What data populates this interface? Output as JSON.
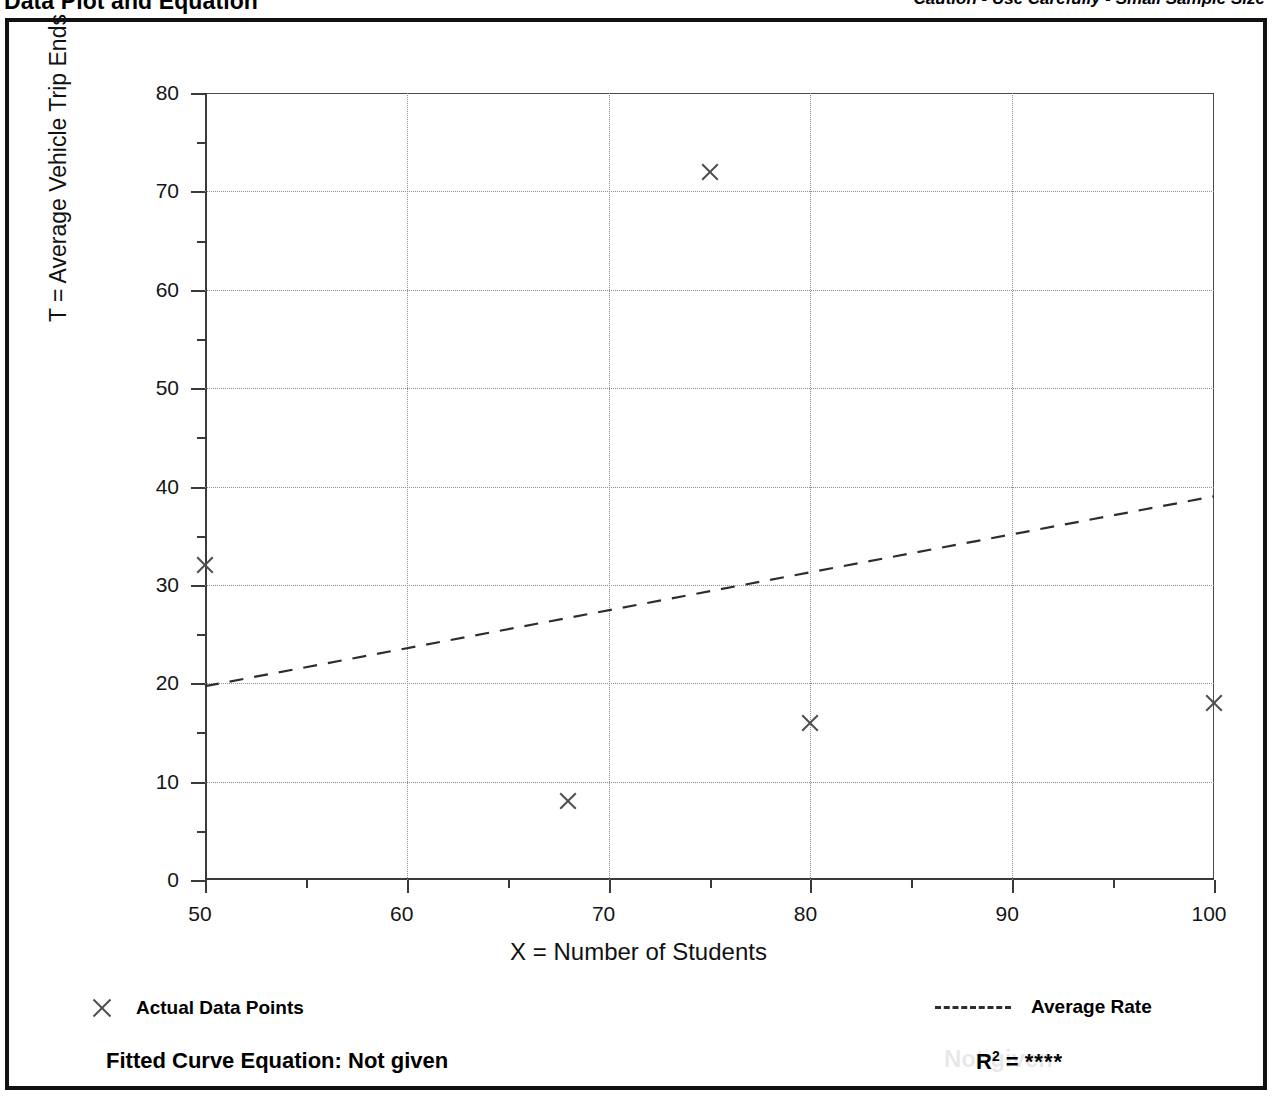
{
  "header": {
    "title": "Data Plot and Equation",
    "caution": "Caution - Use Carefully - Small Sample Size"
  },
  "axis_titles": {
    "y": "T = Average Vehicle Trip Ends",
    "x": "X = Number of Students"
  },
  "legend": {
    "data_points_label": "Actual Data Points",
    "data_points_marker": "x-marker-icon",
    "average_rate_label": "Average Rate",
    "average_rate_marker": "dashed-line-icon"
  },
  "equation": {
    "fitted_label": "Fitted Curve Equation:  Not given",
    "r2_prefix": "R",
    "r2_exponent": "2",
    "r2_equals": " = ",
    "r2_value": "****",
    "ghost_text": "Not given"
  },
  "colors": {
    "frame": "#111111",
    "axis": "#3a3a3a",
    "grid": "#8d8d8d",
    "marker": "#4f4f4f",
    "trend": "#2d2d2d",
    "text": "#000000"
  },
  "chart_data": {
    "type": "scatter",
    "title": "Data Plot and Equation",
    "xlabel": "X = Number of Students",
    "ylabel": "T = Average Vehicle Trip Ends",
    "xlim": [
      50,
      100
    ],
    "ylim": [
      0,
      80
    ],
    "xticks": [
      50,
      60,
      70,
      80,
      90,
      100
    ],
    "yticks": [
      0,
      10,
      20,
      30,
      40,
      50,
      60,
      70,
      80
    ],
    "xminorticks": [
      55,
      65,
      75,
      85,
      95
    ],
    "yminorticks": [
      5,
      15,
      25,
      35,
      45,
      55,
      65,
      75
    ],
    "grid": true,
    "legend_position": "below-axes",
    "series": [
      {
        "name": "Actual Data Points",
        "type": "scatter",
        "marker": "x",
        "points": [
          {
            "x": 50,
            "y": 32
          },
          {
            "x": 68,
            "y": 8
          },
          {
            "x": 75,
            "y": 72
          },
          {
            "x": 80,
            "y": 16
          },
          {
            "x": 100,
            "y": 18
          }
        ]
      },
      {
        "name": "Average Rate",
        "type": "line",
        "style": "dashed",
        "points": [
          {
            "x": 50,
            "y": 19.7
          },
          {
            "x": 100,
            "y": 39.0
          }
        ]
      }
    ],
    "annotations": [
      {
        "text": "Caution - Use Carefully - Small Sample Size",
        "position": "top-right"
      },
      {
        "text": "Fitted Curve Equation:  Not given",
        "position": "bottom-left"
      },
      {
        "text": "R2 = ****",
        "position": "bottom-right"
      }
    ]
  }
}
